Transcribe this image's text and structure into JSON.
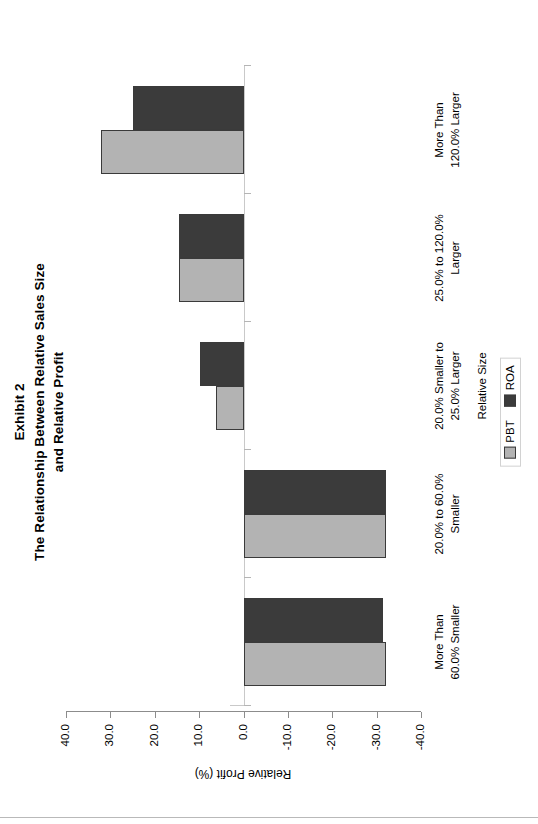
{
  "figure": {
    "exhibit_label": "Exhibit 2",
    "title_line_1": "The Relationship Between Relative Sales Size",
    "title_line_2": "and Relative Profit"
  },
  "legend": {
    "position": "bottom-center",
    "entries": [
      {
        "label": "PBT",
        "color": "#b3b3b3",
        "icon": "legend-swatch-icon"
      },
      {
        "label": "ROA",
        "color": "#3b3b3b",
        "icon": "legend-swatch-icon"
      }
    ]
  },
  "axes": {
    "value_axis_title": "Relative Profit (%)",
    "category_axis_title": "Relative Size",
    "value_ticks": [
      "40.0",
      "30.0",
      "20.0",
      "10.0",
      "0.0",
      "-10.0",
      "-20.0",
      "-30.0",
      "-40.0"
    ]
  },
  "chart_data": {
    "type": "bar",
    "orientation": "vertical-rendered-sideways",
    "xlabel": "Relative Size",
    "ylabel": "Relative Profit (%)",
    "ylim": [
      -40.0,
      40.0
    ],
    "ytick_step": 10.0,
    "grid": false,
    "legend_position": "bottom-center",
    "categories": [
      "More Than 60.0% Smaller",
      "20.0% to 60.0% Smaller",
      "20.0% Smaller to 25.0% Larger",
      "25.0% to 120.0% Larger",
      "More Than 120.0% Larger"
    ],
    "category_label_lines": [
      [
        "More Than",
        "60.0% Smaller"
      ],
      [
        "20.0% to 60.0%",
        "Smaller"
      ],
      [
        "20.0% Smaller to",
        "25.0% Larger"
      ],
      [
        "25.0% to 120.0%",
        "Larger"
      ],
      [
        "More Than",
        "120.0% Larger"
      ]
    ],
    "series": [
      {
        "name": "PBT",
        "color": "#b3b3b3",
        "values": [
          -32.2,
          -32.0,
          6.1,
          14.6,
          32.2
        ]
      },
      {
        "name": "ROA",
        "color": "#3b3b3b",
        "values": [
          -31.5,
          -32.0,
          9.8,
          14.6,
          24.9
        ]
      }
    ]
  }
}
